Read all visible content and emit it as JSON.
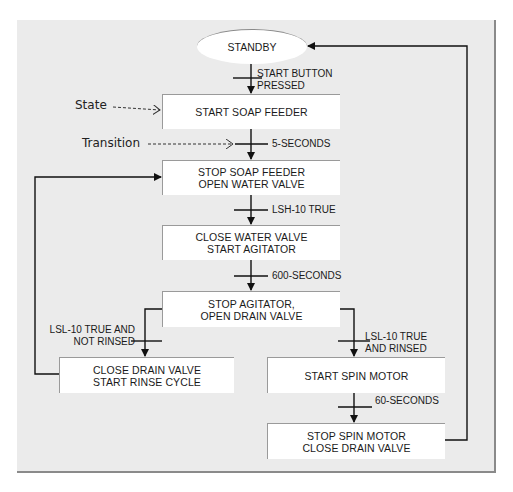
{
  "diagram": {
    "legend": {
      "state_label": "State",
      "transition_label": "Transition"
    },
    "initial_state": {
      "label": "STANDBY"
    },
    "states": [
      {
        "id": "start_soap_feeder",
        "lines": [
          "START SOAP FEEDER"
        ]
      },
      {
        "id": "stop_soap_open_water",
        "lines": [
          "STOP SOAP FEEDER",
          "OPEN WATER VALVE"
        ]
      },
      {
        "id": "close_water_start_agitator",
        "lines": [
          "CLOSE WATER VALVE",
          "START AGITATOR"
        ]
      },
      {
        "id": "stop_agitator_open_drain",
        "lines": [
          "STOP AGITATOR,",
          "OPEN DRAIN VALVE"
        ]
      },
      {
        "id": "close_drain_start_rinse",
        "lines": [
          "CLOSE DRAIN VALVE",
          "START RINSE CYCLE"
        ]
      },
      {
        "id": "start_spin_motor",
        "lines": [
          "START SPIN MOTOR"
        ]
      },
      {
        "id": "stop_spin_close_drain",
        "lines": [
          "STOP SPIN MOTOR",
          "CLOSE DRAIN VALVE"
        ]
      }
    ],
    "transitions": [
      {
        "from": "STANDBY",
        "to": "start_soap_feeder",
        "lines": [
          "START BUTTON",
          "PRESSED"
        ]
      },
      {
        "from": "start_soap_feeder",
        "to": "stop_soap_open_water",
        "lines": [
          "5-SECONDS"
        ]
      },
      {
        "from": "stop_soap_open_water",
        "to": "close_water_start_agitator",
        "lines": [
          "LSH-10 TRUE"
        ]
      },
      {
        "from": "close_water_start_agitator",
        "to": "stop_agitator_open_drain",
        "lines": [
          "600-SECONDS"
        ]
      },
      {
        "from": "stop_agitator_open_drain",
        "to": "close_drain_start_rinse",
        "lines": [
          "LSL-10 TRUE AND",
          "NOT RINSED"
        ]
      },
      {
        "from": "stop_agitator_open_drain",
        "to": "start_spin_motor",
        "lines": [
          "LSL-10 TRUE",
          "AND RINSED"
        ]
      },
      {
        "from": "start_spin_motor",
        "to": "stop_spin_close_drain",
        "lines": [
          "60-SECONDS"
        ]
      },
      {
        "from": "close_drain_start_rinse",
        "to": "stop_soap_open_water",
        "lines": []
      },
      {
        "from": "stop_spin_close_drain",
        "to": "STANDBY",
        "lines": []
      }
    ]
  }
}
